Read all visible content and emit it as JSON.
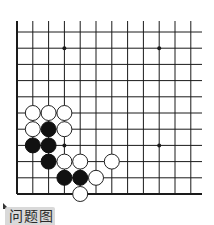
{
  "diagram": {
    "type": "go-board-partial",
    "label": "问题图",
    "grid": {
      "columns": 12,
      "rows": 11,
      "origin_x": 17,
      "origin_y": 32,
      "col_spacing": 15.8,
      "row_spacing": 16.2,
      "right_extent": 202,
      "top_extent": 21,
      "line_color": "#1a1a1a",
      "left_border_width": 2,
      "bottom_border_width": 2
    },
    "star_points": [
      {
        "col": 3,
        "row": 1
      },
      {
        "col": 9,
        "row": 1
      },
      {
        "col": 3,
        "row": 7
      },
      {
        "col": 9,
        "row": 7
      }
    ],
    "stones": [
      {
        "color": "white",
        "col": 1,
        "row": 5
      },
      {
        "color": "white",
        "col": 2,
        "row": 5
      },
      {
        "color": "white",
        "col": 3,
        "row": 5
      },
      {
        "color": "white",
        "col": 1,
        "row": 6
      },
      {
        "color": "black",
        "col": 2,
        "row": 6
      },
      {
        "color": "white",
        "col": 3,
        "row": 6
      },
      {
        "color": "black",
        "col": 1,
        "row": 7
      },
      {
        "color": "black",
        "col": 2,
        "row": 7
      },
      {
        "color": "black",
        "col": 2,
        "row": 8
      },
      {
        "color": "white",
        "col": 3,
        "row": 8
      },
      {
        "color": "white",
        "col": 4,
        "row": 8
      },
      {
        "color": "white",
        "col": 6,
        "row": 8
      },
      {
        "color": "black",
        "col": 3,
        "row": 9
      },
      {
        "color": "black",
        "col": 4,
        "row": 9
      },
      {
        "color": "white",
        "col": 5,
        "row": 9
      },
      {
        "color": "white",
        "col": 4,
        "row": 10
      }
    ],
    "colors": {
      "black_stone": "#111111",
      "white_stone_fill": "#ffffff",
      "white_stone_stroke": "#222222",
      "label_bg": "#d9d9d9",
      "label_text": "#2b2b2b"
    }
  }
}
